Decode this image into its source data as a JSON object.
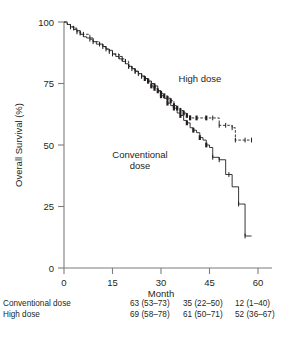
{
  "chart_data": {
    "type": "line",
    "title": "",
    "xlabel": "Month",
    "ylabel": "Overall Survival (%)",
    "xlim": [
      0,
      62
    ],
    "ylim": [
      0,
      100
    ],
    "xticks": [
      0,
      15,
      30,
      45,
      60
    ],
    "yticks": [
      0,
      25,
      50,
      75,
      100
    ],
    "grid": false,
    "legend_position": "inline-annotation",
    "annotations": [
      {
        "text": "High dose",
        "x": 42,
        "y": 76
      },
      {
        "text": "Conventional\ndose",
        "x": 26,
        "y": 43
      }
    ],
    "series": [
      {
        "name": "Conventional dose",
        "style": "solid",
        "points": [
          [
            0,
            100
          ],
          [
            1,
            99
          ],
          [
            2,
            98
          ],
          [
            3,
            97
          ],
          [
            4,
            96.5
          ],
          [
            5,
            95
          ],
          [
            6,
            94
          ],
          [
            7,
            93.5
          ],
          [
            9,
            92
          ],
          [
            10,
            91
          ],
          [
            12,
            90
          ],
          [
            13,
            89
          ],
          [
            14,
            88.5
          ],
          [
            15,
            87
          ],
          [
            16,
            86
          ],
          [
            17,
            85
          ],
          [
            18,
            84
          ],
          [
            19,
            83
          ],
          [
            20,
            82
          ],
          [
            21,
            81
          ],
          [
            22,
            80
          ],
          [
            23,
            79
          ],
          [
            24,
            78
          ],
          [
            25,
            77
          ],
          [
            26,
            76
          ],
          [
            27,
            75
          ],
          [
            28,
            74
          ],
          [
            29,
            72
          ],
          [
            30,
            70
          ],
          [
            31,
            69
          ],
          [
            32,
            67
          ],
          [
            33,
            66
          ],
          [
            34,
            65
          ],
          [
            35,
            63
          ],
          [
            36,
            62
          ],
          [
            37,
            60
          ],
          [
            38,
            59
          ],
          [
            39,
            57
          ],
          [
            40,
            56
          ],
          [
            41,
            55
          ],
          [
            42,
            53
          ],
          [
            43,
            52
          ],
          [
            44,
            50
          ],
          [
            45,
            49
          ],
          [
            46,
            45
          ],
          [
            47,
            45
          ],
          [
            48,
            44
          ],
          [
            50,
            38
          ],
          [
            51,
            38
          ],
          [
            52,
            33
          ],
          [
            54,
            26
          ],
          [
            55,
            26
          ],
          [
            56,
            13
          ],
          [
            58,
            13
          ]
        ]
      },
      {
        "name": "High dose",
        "style": "dashed",
        "points": [
          [
            0,
            100
          ],
          [
            1,
            99
          ],
          [
            2,
            98
          ],
          [
            3,
            97.5
          ],
          [
            4,
            96
          ],
          [
            5,
            95.5
          ],
          [
            6,
            95
          ],
          [
            8,
            93
          ],
          [
            9,
            92
          ],
          [
            11,
            91
          ],
          [
            12,
            90
          ],
          [
            13,
            89
          ],
          [
            14,
            88
          ],
          [
            15,
            87
          ],
          [
            17,
            86
          ],
          [
            18,
            85
          ],
          [
            19,
            84
          ],
          [
            20,
            82
          ],
          [
            21,
            81
          ],
          [
            22,
            80
          ],
          [
            23,
            79
          ],
          [
            24,
            78
          ],
          [
            25,
            77
          ],
          [
            26,
            76
          ],
          [
            27,
            74
          ],
          [
            28,
            73
          ],
          [
            29,
            72
          ],
          [
            30,
            71
          ],
          [
            31,
            70
          ],
          [
            32,
            69
          ],
          [
            33,
            68
          ],
          [
            34,
            66
          ],
          [
            35,
            65
          ],
          [
            36,
            64
          ],
          [
            37,
            63
          ],
          [
            38,
            62
          ],
          [
            39,
            61
          ],
          [
            41,
            61
          ],
          [
            44,
            61
          ],
          [
            46,
            61
          ],
          [
            48,
            58
          ],
          [
            50,
            58
          ],
          [
            52,
            57
          ],
          [
            53,
            52
          ],
          [
            56,
            52
          ],
          [
            58,
            52
          ]
        ]
      }
    ],
    "risk_table": {
      "row_header": "",
      "columns": [
        "30",
        "45",
        "60"
      ],
      "rows": [
        {
          "label": "Conventional dose",
          "values": [
            "63 (53–73)",
            "35 (22–50)",
            "12 (1–40)"
          ]
        },
        {
          "label": "High dose",
          "values": [
            "69 (58–78)",
            "61 (50–71)",
            "52 (36–67)"
          ]
        }
      ]
    }
  },
  "axis": {
    "ylabel": "Overall Survival (%)",
    "xlabel": "Month",
    "yticks": [
      "100",
      "75",
      "50",
      "25",
      "0"
    ],
    "xticks": [
      "0",
      "15",
      "30",
      "45",
      "60"
    ]
  },
  "labels": {
    "high_dose": "High dose",
    "conventional_line1": "Conventional",
    "conventional_line2": "dose"
  },
  "colors": {
    "ink": "#231f20",
    "axis": "#7d7d7d",
    "background": "#ffffff"
  }
}
